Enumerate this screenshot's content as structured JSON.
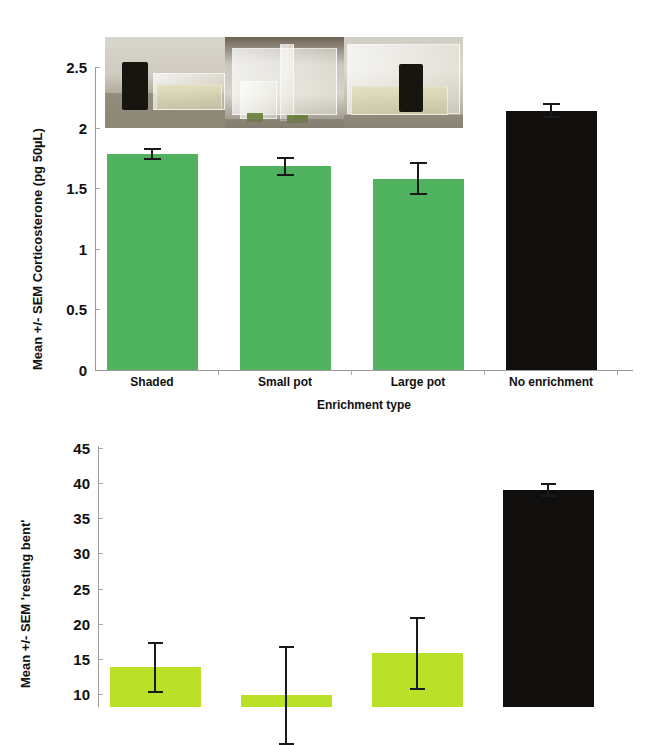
{
  "figure": {
    "title": "",
    "panels": [
      "corticosterone-panel",
      "resting-bent-panel"
    ]
  },
  "inset_photos": {
    "name": "enrichment-setup-photo-strip",
    "caption": "",
    "items": [
      {
        "name": "photo-shaded-tank",
        "description": "black shaded block beside clear tub"
      },
      {
        "name": "photo-small-pot-tank",
        "description": "clear small pot in tank"
      },
      {
        "name": "photo-large-pot-tank",
        "description": "black large pot in clear tank"
      }
    ]
  },
  "chart_data": [
    {
      "id": "corticosterone-panel",
      "type": "bar",
      "title": "",
      "xlabel": "Enrichment type",
      "ylabel": "Mean +/- SEM Corticosterone (pg 50µL)",
      "categories": [
        "Shaded",
        "Small pot",
        "Large pot",
        "No enrichment"
      ],
      "values": [
        1.78,
        1.68,
        1.58,
        2.14
      ],
      "errors": [
        0.05,
        0.08,
        0.14,
        0.06
      ],
      "colors": [
        "#4eb25f",
        "#4eb25f",
        "#4eb25f",
        "#100f0d"
      ],
      "ylim": [
        0,
        2.5
      ],
      "yticks": [
        "0",
        "0.5",
        "1",
        "1.5",
        "2",
        "2.5"
      ],
      "ytick_values": [
        0,
        0.5,
        1,
        1.5,
        2,
        2.5
      ],
      "grid": false,
      "legend": "none"
    },
    {
      "id": "resting-bent-panel",
      "type": "bar",
      "title": "",
      "xlabel": "",
      "ylabel": "Mean +/- SEM 'resting bent'",
      "categories": [
        "Shaded",
        "Small pot",
        "Large pot",
        "No enrichment"
      ],
      "values": [
        13.8,
        9.8,
        15.8,
        39.0
      ],
      "errors": [
        3.6,
        7.0,
        5.2,
        1.0
      ],
      "colors": [
        "#bbe028",
        "#bbe028",
        "#bbe028",
        "#100f0d"
      ],
      "ylim": [
        5,
        45
      ],
      "yticks": [
        "10",
        "15",
        "20",
        "25",
        "30",
        "35",
        "40",
        "45"
      ],
      "ytick_values": [
        10,
        15,
        20,
        25,
        30,
        35,
        40,
        45
      ],
      "grid": false,
      "legend": "none",
      "note": "panel is cropped at the bottom of the image"
    }
  ],
  "colors": {
    "bar_green_top": "#4eb25f",
    "bar_green_bottom": "#bbe028",
    "bar_black": "#100f0d",
    "axis": "#9a9a9a",
    "text": "#111111",
    "background": "#ffffff"
  }
}
